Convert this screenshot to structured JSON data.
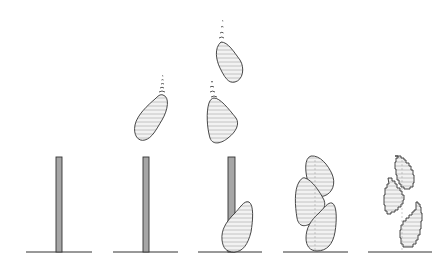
{
  "diagram": {
    "type": "sequence-illustration",
    "panels": [
      {
        "id": 1,
        "description": "Vertical support pole on ground"
      },
      {
        "id": 2,
        "description": "Pole with first blob dropping from above"
      },
      {
        "id": 3,
        "description": "Pole with one blob placed at base and two blobs dropping"
      },
      {
        "id": 4,
        "description": "Three stacked blobs, smooth outline"
      },
      {
        "id": 5,
        "description": "Three stacked blobs, stepped/voxelized outline"
      }
    ],
    "colors": {
      "pole_fill": "#a6a6a6",
      "stroke": "#333333",
      "hatch": "#b8b8b8",
      "background": "#ffffff"
    }
  }
}
